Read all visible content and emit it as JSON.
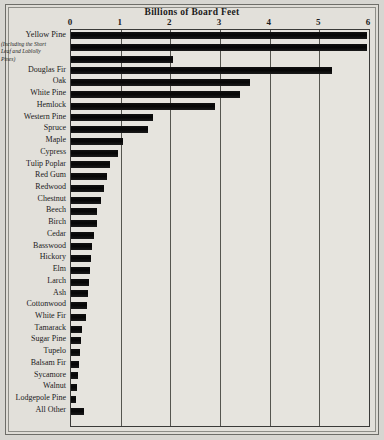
{
  "chart": {
    "title": "Billions of Board Feet",
    "axis_ticks": [
      "0",
      "1",
      "2",
      "3",
      "4",
      "5",
      "6"
    ],
    "yellow_pine_note_lines": [
      "(Including the Short",
      "Leaf and Loblolly",
      "Pines)"
    ]
  },
  "chart_data": {
    "type": "bar",
    "orientation": "horizontal",
    "title": "Billions of Board Feet",
    "xlabel": "Billions of Board Feet",
    "ylabel": "",
    "xlim": [
      0,
      6
    ],
    "xticks": [
      0,
      1,
      2,
      3,
      4,
      5,
      6
    ],
    "grid": true,
    "legend": "none",
    "categories": [
      "Yellow Pine",
      "Yellow Pine",
      "Yellow Pine",
      "Douglas Fir",
      "Oak",
      "White Pine",
      "Hemlock",
      "Western Pine",
      "Spruce",
      "Maple",
      "Cypress",
      "Tulip Poplar",
      "Red Gum",
      "Redwood",
      "Chestnut",
      "Beech",
      "Birch",
      "Cedar",
      "Basswood",
      "Hickory",
      "Elm",
      "Larch",
      "Ash",
      "Cottonwood",
      "White Fir",
      "Tamarack",
      "Sugar Pine",
      "Tupelo",
      "Balsam Fir",
      "Sycamore",
      "Walnut",
      "Lodgepole Pine",
      "All Other"
    ],
    "values": [
      5.95,
      5.95,
      2.05,
      5.25,
      3.6,
      3.4,
      2.9,
      1.65,
      1.55,
      1.05,
      0.95,
      0.78,
      0.72,
      0.66,
      0.6,
      0.53,
      0.52,
      0.47,
      0.43,
      0.4,
      0.38,
      0.36,
      0.34,
      0.33,
      0.3,
      0.22,
      0.2,
      0.18,
      0.17,
      0.15,
      0.13,
      0.1,
      0.26
    ]
  },
  "labels": [
    {
      "text": "Yellow Pine",
      "emphasis": "big"
    },
    {
      "text": "Douglas Fir"
    },
    {
      "text": "Oak"
    },
    {
      "text": "White Pine"
    },
    {
      "text": "Hemlock"
    },
    {
      "text": "Western Pine"
    },
    {
      "text": "Spruce"
    },
    {
      "text": "Maple"
    },
    {
      "text": "Cypress"
    },
    {
      "text": "Tulip Poplar"
    },
    {
      "text": "Red Gum"
    },
    {
      "text": "Redwood"
    },
    {
      "text": "Chestnut"
    },
    {
      "text": "Beech"
    },
    {
      "text": "Birch"
    },
    {
      "text": "Cedar"
    },
    {
      "text": "Basswood"
    },
    {
      "text": "Hickory"
    },
    {
      "text": "Elm"
    },
    {
      "text": "Larch"
    },
    {
      "text": "Ash"
    },
    {
      "text": "Cottonwood"
    },
    {
      "text": "White Fir"
    },
    {
      "text": "Tamarack"
    },
    {
      "text": "Sugar Pine"
    },
    {
      "text": "Tupelo"
    },
    {
      "text": "Balsam Fir"
    },
    {
      "text": "Sycamore"
    },
    {
      "text": "Walnut"
    },
    {
      "text": "Lodgepole Pine"
    },
    {
      "text": "All Other"
    }
  ],
  "colors": {
    "bar": "#0d0d0d",
    "paper": "#e2e0da",
    "axis": "#3a3a38",
    "grid": "#55554f",
    "text": "#1a1a1a"
  }
}
